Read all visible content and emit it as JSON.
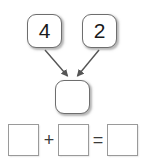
{
  "diagram": {
    "type": "number-bond-part-whole",
    "parts": [
      {
        "id": "addend-a",
        "value": "4"
      },
      {
        "id": "addend-b",
        "value": "2"
      }
    ],
    "whole": {
      "id": "sum",
      "value": ""
    },
    "arrows": [
      {
        "from": "addend-a",
        "to": "sum",
        "direction": "down-right"
      },
      {
        "from": "addend-b",
        "to": "sum",
        "direction": "down-left"
      }
    ],
    "arrow_color": "#555555"
  },
  "equation": {
    "blank_1": "",
    "operator_plus": "+",
    "blank_2": "",
    "operator_equals": "=",
    "blank_3": ""
  },
  "colors": {
    "background": "#ffffff",
    "bond_box_border": "#6e6e6e",
    "equation_box_border": "#9a9a9a",
    "text": "#1a1a1a"
  }
}
